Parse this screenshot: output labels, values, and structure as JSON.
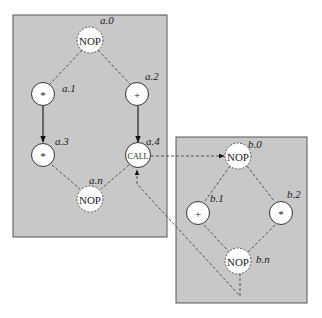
{
  "diagram": {
    "type": "control-flow-graph",
    "procedures": [
      {
        "id": "a",
        "nodes": [
          {
            "id": "a.0",
            "label": "a.0",
            "op": "NOP",
            "style": "dashed"
          },
          {
            "id": "a.1",
            "label": "a.1",
            "op": "*",
            "style": "solid"
          },
          {
            "id": "a.2",
            "label": "a.2",
            "op": "+",
            "style": "solid"
          },
          {
            "id": "a.3",
            "label": "a.3",
            "op": "*",
            "style": "solid"
          },
          {
            "id": "a.4",
            "label": "a.4",
            "op": "CALL",
            "style": "solid"
          },
          {
            "id": "a.n",
            "label": "a.n",
            "op": "NOP",
            "style": "dashed"
          }
        ]
      },
      {
        "id": "b",
        "nodes": [
          {
            "id": "b.0",
            "label": "b.0",
            "op": "NOP",
            "style": "dashed"
          },
          {
            "id": "b.1",
            "label": "b.1",
            "op": "+",
            "style": "solid"
          },
          {
            "id": "b.2",
            "label": "b.2",
            "op": "*",
            "style": "solid"
          },
          {
            "id": "b.n",
            "label": "b.n",
            "op": "NOP",
            "style": "dashed"
          }
        ]
      }
    ],
    "edges": [
      {
        "from": "a.0",
        "to": "a.1",
        "style": "dashed"
      },
      {
        "from": "a.0",
        "to": "a.2",
        "style": "dashed"
      },
      {
        "from": "a.1",
        "to": "a.3",
        "style": "solid-arrow"
      },
      {
        "from": "a.2",
        "to": "a.4",
        "style": "solid-arrow"
      },
      {
        "from": "a.3",
        "to": "a.n",
        "style": "dashed"
      },
      {
        "from": "a.4",
        "to": "a.n",
        "style": "dashed"
      },
      {
        "from": "a.4",
        "to": "b.0",
        "style": "dashed-arrow"
      },
      {
        "from": "b.0",
        "to": "b.1",
        "style": "dashed"
      },
      {
        "from": "b.0",
        "to": "b.2",
        "style": "dashed"
      },
      {
        "from": "b.1",
        "to": "b.n",
        "style": "dashed"
      },
      {
        "from": "b.2",
        "to": "b.n",
        "style": "dashed"
      },
      {
        "from": "b.n",
        "to": "a.4",
        "style": "dashed-arrow"
      }
    ]
  },
  "nodes": {
    "a0": {
      "label": "a.0",
      "op": "NOP"
    },
    "a1": {
      "label": "a.1",
      "op": "*"
    },
    "a2": {
      "label": "a.2",
      "op": "+"
    },
    "a3": {
      "label": "a.3",
      "op": "*"
    },
    "a4": {
      "label": "a.4",
      "op": "CALL"
    },
    "an": {
      "label": "a.n",
      "op": "NOP"
    },
    "b0": {
      "label": "b.0",
      "op": "NOP"
    },
    "b1": {
      "label": "b.1",
      "op": "+"
    },
    "b2": {
      "label": "b.2",
      "op": "*"
    },
    "bn": {
      "label": "b.n",
      "op": "NOP"
    }
  }
}
